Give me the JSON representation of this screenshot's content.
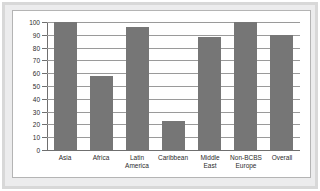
{
  "chart_data": {
    "type": "bar",
    "title": "",
    "xlabel": "",
    "ylabel": "",
    "grid": true,
    "legend": "none",
    "ylim": [
      0,
      100
    ],
    "yticks": [
      0,
      10,
      20,
      30,
      40,
      50,
      60,
      70,
      80,
      90,
      100
    ],
    "ytick_labels": [
      "0",
      "10",
      "20",
      "30",
      "40",
      "50",
      "60",
      "70",
      "80",
      "90",
      "100"
    ],
    "categories": [
      "Asia",
      "Africa",
      "Latin\nAmerica",
      "Caribbean",
      "Middle\nEast",
      "Non-BCBS\nEurope",
      "Overall"
    ],
    "values": [
      100,
      58,
      96,
      23,
      88,
      100,
      90
    ],
    "bar_color": "#767676",
    "gridline_color": "#9a9a9a",
    "axis_color": "#6f6f6f",
    "plot_background": "#ffffff",
    "frame_color": "#d8d8d8"
  }
}
